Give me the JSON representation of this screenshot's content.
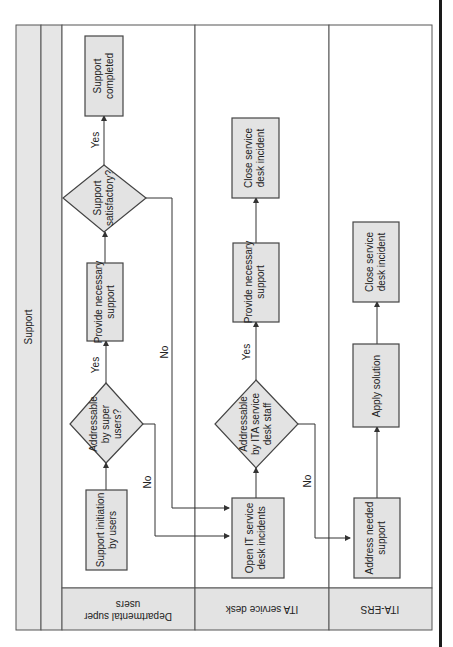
{
  "diagram": {
    "title": "Support",
    "orientation": "rotated-90-ccw",
    "lanes": [
      {
        "id": "dept",
        "label_line1": "Departmental super",
        "label_line2": "users"
      },
      {
        "id": "ita_sd",
        "label": "ITA service desk"
      },
      {
        "id": "ita_ers",
        "label": "ITA-ERS"
      }
    ],
    "nodes": {
      "support_initiation": {
        "line1": "Support initiation",
        "line2": "by users"
      },
      "addressable_super": {
        "line1": "Addressable",
        "line2": "by super",
        "line3": "users?"
      },
      "provide_support_1": {
        "line1": "Provide necessary",
        "line2": "support"
      },
      "support_satisfactory": {
        "line1": "Support",
        "line2": "satisfactory?"
      },
      "support_completed": {
        "line1": "Support",
        "line2": "completed"
      },
      "open_incidents": {
        "line1": "Open IT service",
        "line2": "desk incidents"
      },
      "addressable_ita": {
        "line1": "Addressable",
        "line2": "by ITA service",
        "line3": "desk staff"
      },
      "provide_support_2": {
        "line1": "Provide necessary",
        "line2": "support"
      },
      "close_incident_1": {
        "line1": "Close service",
        "line2": "desk incident"
      },
      "address_needed": {
        "line1": "Address needed",
        "line2": "support"
      },
      "apply_solution": {
        "line1": "Apply solution"
      },
      "close_incident_2": {
        "line1": "Close service",
        "line2": "desk incident"
      }
    },
    "edge_labels": {
      "yes_1": "Yes",
      "yes_2": "Yes",
      "yes_3": "Yes",
      "no_1": "No",
      "no_2": "No",
      "no_3": "No"
    }
  },
  "colors": {
    "shape_fill": "#e3e3e3",
    "band_fill": "#e6e6e6",
    "stroke": "#444444",
    "right_bar": "#1a1a1a"
  }
}
